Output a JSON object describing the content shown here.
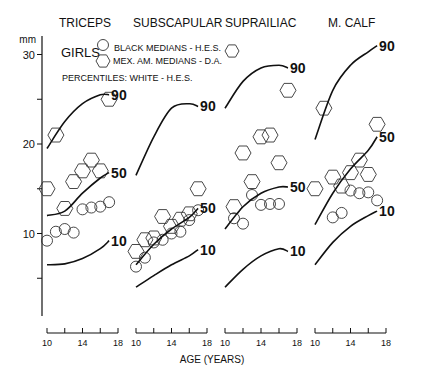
{
  "chart_data": {
    "type": "line",
    "title": "",
    "subtitle": "GIRLS",
    "ylabel": "mm",
    "xlabel": "AGE (YEARS)",
    "ylim": [
      0,
      32
    ],
    "yticks": [
      30,
      20,
      10
    ],
    "xticks": [
      10,
      12,
      14,
      16,
      18
    ],
    "xtick_labels": [
      "10",
      "14",
      "18"
    ],
    "grid": false,
    "legend": {
      "position": "top-left",
      "entries": [
        {
          "marker": "circle",
          "label": "BLACK MEDIANS - H.E.S."
        },
        {
          "marker": "hexagon",
          "label": "MEX. AM. MEDIANS - D.A."
        },
        {
          "marker": "line",
          "label": "PERCENTILES: WHITE - H.E.S."
        }
      ]
    },
    "panels": [
      {
        "name": "TRICEPS",
        "percentiles": [
          {
            "name": "90",
            "x": [
              10,
              12,
              14,
              16,
              17
            ],
            "y": [
              19.5,
              22.5,
              24.5,
              25.5,
              25.5
            ]
          },
          {
            "name": "50",
            "x": [
              10,
              12,
              14,
              16,
              17
            ],
            "y": [
              12,
              12.5,
              14.5,
              16.2,
              16.8
            ]
          },
          {
            "name": "10",
            "x": [
              10,
              12,
              14,
              16,
              17
            ],
            "y": [
              6.5,
              6.6,
              7.2,
              8.3,
              9.2
            ]
          }
        ],
        "black_medians": {
          "x": [
            10,
            11,
            12,
            13,
            14,
            15,
            16,
            17
          ],
          "y": [
            9.2,
            10.2,
            10.5,
            10.1,
            12.7,
            12.9,
            13.0,
            13.5
          ]
        },
        "mex_am_medians": {
          "x": [
            10,
            11,
            12,
            13,
            14,
            15,
            16,
            17
          ],
          "y": [
            15.0,
            21.0,
            12.8,
            15.8,
            17.0,
            18.2,
            17.0,
            25.0
          ]
        }
      },
      {
        "name": "SUBSCAPULAR",
        "percentiles": [
          {
            "name": "90",
            "x": [
              10,
              12,
              14,
              16,
              17
            ],
            "y": [
              16.5,
              20.8,
              24.0,
              24.5,
              24.2
            ]
          },
          {
            "name": "50",
            "x": [
              10,
              12,
              14,
              16,
              17
            ],
            "y": [
              6.5,
              8.8,
              10.5,
              11.8,
              12.8
            ]
          },
          {
            "name": "10",
            "x": [
              10,
              12,
              14,
              16,
              17
            ],
            "y": [
              4.0,
              5.3,
              6.5,
              7.5,
              8.2
            ]
          }
        ],
        "black_medians": {
          "x": [
            10,
            11,
            12,
            13,
            14,
            15,
            16,
            17
          ],
          "y": [
            6.3,
            7.3,
            9.0,
            9.3,
            10.0,
            10.2,
            11.5,
            12.6
          ]
        },
        "mex_am_medians": {
          "x": [
            10,
            11,
            12,
            13,
            14,
            15,
            16,
            17
          ],
          "y": [
            8.0,
            9.3,
            9.5,
            11.9,
            10.8,
            11.6,
            12.2,
            15.0
          ]
        }
      },
      {
        "name": "SUPRAILIAC",
        "percentiles": [
          {
            "name": "90",
            "x": [
              10,
              12,
              14,
              16,
              17
            ],
            "y": [
              24.0,
              27.0,
              28.5,
              28.8,
              28.5
            ]
          },
          {
            "name": "50",
            "x": [
              10,
              12,
              14,
              16,
              17
            ],
            "y": [
              10.5,
              13.0,
              14.5,
              15.2,
              15.2
            ]
          },
          {
            "name": "10",
            "x": [
              10,
              12,
              14,
              16,
              17
            ],
            "y": [
              4.0,
              6.0,
              7.5,
              8.3,
              8.0
            ]
          }
        ],
        "black_medians": {
          "x": [
            11,
            12,
            13,
            14,
            15,
            16
          ],
          "y": [
            11.7,
            11.1,
            14.3,
            13.2,
            13.3,
            13.3
          ]
        },
        "mex_am_medians": {
          "x": [
            11,
            12,
            13,
            14,
            15,
            16,
            17
          ],
          "y": [
            13.0,
            19.0,
            15.8,
            20.8,
            21.0,
            17.9,
            26.0
          ]
        }
      },
      {
        "name": "M. CALF",
        "percentiles": [
          {
            "name": "90",
            "x": [
              10,
              12,
              14,
              16,
              17
            ],
            "y": [
              20.5,
              26.0,
              28.8,
              30.3,
              31.0
            ]
          },
          {
            "name": "50",
            "x": [
              10,
              12,
              14,
              16,
              17
            ],
            "y": [
              11.0,
              14.5,
              17.2,
              19.3,
              20.8
            ]
          },
          {
            "name": "10",
            "x": [
              10,
              12,
              14,
              16,
              17
            ],
            "y": [
              6.5,
              9.0,
              10.8,
              12.0,
              12.5
            ]
          }
        ],
        "black_medians": {
          "x": [
            12,
            13,
            14,
            15,
            16,
            17
          ],
          "y": [
            11.8,
            12.3,
            14.8,
            14.5,
            14.6,
            13.7
          ]
        },
        "mex_am_medians": {
          "x": [
            10,
            11,
            12,
            13,
            14,
            15,
            16,
            17
          ],
          "y": [
            15.0,
            24.0,
            16.3,
            15.3,
            16.8,
            18.2,
            16.6,
            22.2
          ]
        }
      }
    ]
  },
  "labels": {
    "panels": [
      "TRICEPS",
      "SUBSCAPULAR",
      "SUPRAILIAC",
      "M. CALF"
    ],
    "y_unit": "mm",
    "y_ticks": [
      "30",
      "20",
      "10"
    ],
    "girls": "GIRLS",
    "legend_black": "BLACK MEDIANS - H.E.S.",
    "legend_mex": "MEX. AM. MEDIANS - D.A.",
    "legend_pct": "PERCENTILES: WHITE - H.E.S.",
    "x_title": "AGE (YEARS)",
    "x_ticks": [
      "10",
      "14",
      "18"
    ],
    "pct_labels": [
      "90",
      "50",
      "10"
    ]
  }
}
